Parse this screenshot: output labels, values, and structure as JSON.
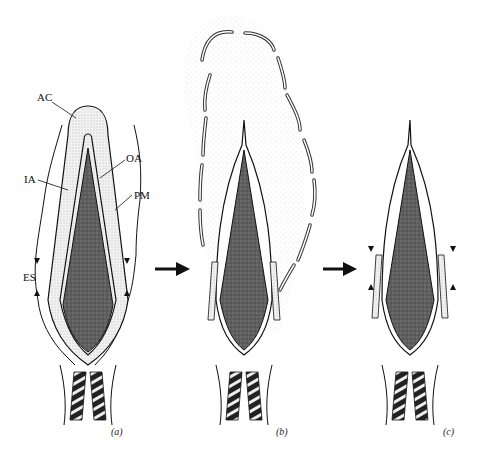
{
  "figure": {
    "panels": [
      {
        "id": "a",
        "caption": "(a)"
      },
      {
        "id": "b",
        "caption": "(b)"
      },
      {
        "id": "c",
        "caption": "(c)"
      }
    ],
    "labels": {
      "ac": "AC",
      "oa": "OA",
      "ia": "IA",
      "pm": "PM",
      "es": "ES"
    },
    "colors": {
      "ink": "#111111",
      "nucleus": "#6a6a6a",
      "acrosome_stipple": "#d8d8d8",
      "background": "#ffffff"
    }
  }
}
